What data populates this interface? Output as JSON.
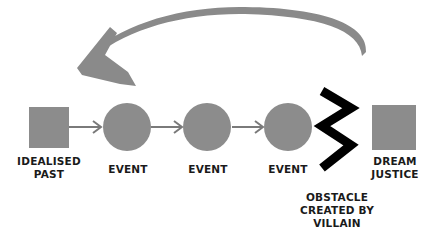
{
  "colors": {
    "shape_fill": "#8c8c8c",
    "connector": "#7a7a7a",
    "return_arrow": "#8a8a8a",
    "obstacle": "#000000",
    "text": "#1a1a1a"
  },
  "nodes": [
    {
      "id": "idealised-past",
      "shape": "square",
      "label": "IDEALISED\nPAST",
      "label_lines": [
        "IDEALISED",
        "PAST"
      ]
    },
    {
      "id": "event-1",
      "shape": "circle",
      "label_lines": [
        "EVENT"
      ]
    },
    {
      "id": "event-2",
      "shape": "circle",
      "label_lines": [
        "EVENT"
      ]
    },
    {
      "id": "event-3",
      "shape": "circle",
      "label_lines": [
        "EVENT"
      ]
    },
    {
      "id": "obstacle",
      "shape": "zigzag",
      "label_lines": [
        "OBSTACLE",
        "CREATED BY",
        "VILLAIN"
      ]
    },
    {
      "id": "dream-justice",
      "shape": "square",
      "label_lines": [
        "DREAM",
        "JUSTICE"
      ]
    }
  ],
  "edges": [
    {
      "from": "idealised-past",
      "to": "event-1"
    },
    {
      "from": "event-1",
      "to": "event-2"
    },
    {
      "from": "event-2",
      "to": "event-3"
    }
  ],
  "return_arrow": {
    "from": "obstacle",
    "to": "idealised-past",
    "style": "curved-brush"
  }
}
